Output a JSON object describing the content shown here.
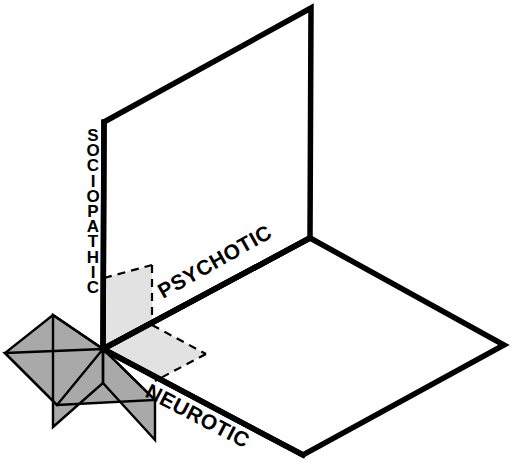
{
  "figure": {
    "type": "three-dimensional-plane-diagram",
    "background_color": "#ffffff",
    "stroke_color": "#000000",
    "shade_dark_color": "#a9a9a9",
    "shade_light_color": "#e2e2e2",
    "dashed_stroke_color": "#000000"
  },
  "labels": {
    "sociopathic": "SOCIOPATHIC",
    "psychotic": "PSYCHOTIC",
    "neurotic": "NEUROTIC"
  },
  "planes": {
    "back_wall": {
      "name": "sociopathic-psychotic-wall",
      "points": "104,122 311,8 310,238 103,349"
    },
    "floor": {
      "name": "neurotic-psychotic-floor",
      "points": "103,349 310,238 504,345 303,455"
    },
    "dark_floor_region": {
      "name": "dark-shaded-floor-region",
      "points": "5,353 103,349 155,400 57,405"
    },
    "dark_wall_region": {
      "name": "dark-shaded-wall-region",
      "points": "53,315 103,349 103,383 53,427"
    },
    "dark_floor_region_b": {
      "name": "dark-shaded-floor-region-b",
      "points": "53,315 103,349 57,405 5,353"
    },
    "dark_wall_region_b": {
      "name": "dark-shaded-wall-region-b",
      "points": "103,349 155,400 155,440 103,383"
    },
    "light_wall_region": {
      "name": "light-shaded-wall-region",
      "points": "104,278 152,265 152,325 103,349"
    },
    "light_floor_region": {
      "name": "light-shaded-floor-region",
      "points": "103,349 152,325 206,354 155,381"
    }
  },
  "dashed_edges": [
    {
      "name": "wall-region-top-edge",
      "x1": 104,
      "y1": 278,
      "x2": 152,
      "y2": 265
    },
    {
      "name": "wall-region-right-edge",
      "x1": 152,
      "y1": 265,
      "x2": 152,
      "y2": 325
    },
    {
      "name": "floor-region-upper-right-edge",
      "x1": 152,
      "y1": 325,
      "x2": 206,
      "y2": 354
    },
    {
      "name": "floor-region-lower-right-edge",
      "x1": 206,
      "y1": 354,
      "x2": 155,
      "y2": 381
    }
  ],
  "label_positions": {
    "sociopathic": {
      "left": 82,
      "top": 128
    },
    "psychotic": {
      "x": 163,
      "y": 299,
      "rotate": -29.5
    },
    "neurotic": {
      "x": 144,
      "y": 396,
      "rotate": 27.5
    }
  }
}
